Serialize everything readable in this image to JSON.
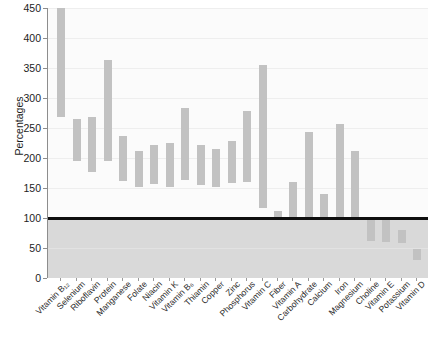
{
  "chart_data": {
    "type": "bar",
    "title": "",
    "xlabel": "",
    "ylabel": "Percentages",
    "ylim": [
      0,
      450
    ],
    "yticks": [
      0,
      50,
      100,
      150,
      200,
      250,
      300,
      350,
      400,
      450
    ],
    "grid": true,
    "legend": "none",
    "orientation": "vertical",
    "bar_style": "floating-range",
    "reference_line": {
      "value": 100,
      "label": "100%",
      "color": "#0f0f0f"
    },
    "shaded_region": {
      "from": 0,
      "to": 100,
      "color": "#d9d9d9"
    },
    "bar_color": "#c2c2c2",
    "note": "Each bar is a floating range spanning a low and high percentage value.",
    "categories": [
      "Vitamin B₁₂",
      "Selenium",
      "Riboflavin",
      "Protein",
      "Manganese",
      "Folate",
      "Niacin",
      "Vitamin K",
      "Vitamin B₆",
      "Thiamin",
      "Copper",
      "Zinc",
      "Phosphorus",
      "Vitamin C",
      "Fiber",
      "Vitamin A",
      "Carbohydrate",
      "Calcium",
      "Iron",
      "Magnesium",
      "Choline",
      "Vitamin E",
      "Potassium",
      "Vitamin D"
    ],
    "ranges": [
      {
        "category": "Vitamin B₁₂",
        "low": 268,
        "high": 460,
        "clipped_top": true
      },
      {
        "category": "Selenium",
        "low": 195,
        "high": 265
      },
      {
        "category": "Riboflavin",
        "low": 177,
        "high": 268
      },
      {
        "category": "Protein",
        "low": 195,
        "high": 363
      },
      {
        "category": "Manganese",
        "low": 162,
        "high": 237
      },
      {
        "category": "Folate",
        "low": 152,
        "high": 212
      },
      {
        "category": "Niacin",
        "low": 157,
        "high": 222
      },
      {
        "category": "Vitamin K",
        "low": 152,
        "high": 225
      },
      {
        "category": "Vitamin B₆",
        "low": 163,
        "high": 283
      },
      {
        "category": "Thiamin",
        "low": 155,
        "high": 222
      },
      {
        "category": "Copper",
        "low": 152,
        "high": 215
      },
      {
        "category": "Zinc",
        "low": 158,
        "high": 228
      },
      {
        "category": "Phosphorus",
        "low": 160,
        "high": 278
      },
      {
        "category": "Vitamin C",
        "low": 117,
        "high": 355
      },
      {
        "category": "Fiber",
        "low": 100,
        "high": 112
      },
      {
        "category": "Vitamin A",
        "low": 100,
        "high": 160
      },
      {
        "category": "Carbohydrate",
        "low": 100,
        "high": 243
      },
      {
        "category": "Calcium",
        "low": 100,
        "high": 140
      },
      {
        "category": "Iron",
        "low": 100,
        "high": 257
      },
      {
        "category": "Magnesium",
        "low": 100,
        "high": 212
      },
      {
        "category": "Choline",
        "low": 62,
        "high": 102
      },
      {
        "category": "Vitamin E",
        "low": 60,
        "high": 100
      },
      {
        "category": "Potassium",
        "low": 58,
        "high": 80
      },
      {
        "category": "Vitamin D",
        "low": 30,
        "high": 48
      }
    ]
  }
}
